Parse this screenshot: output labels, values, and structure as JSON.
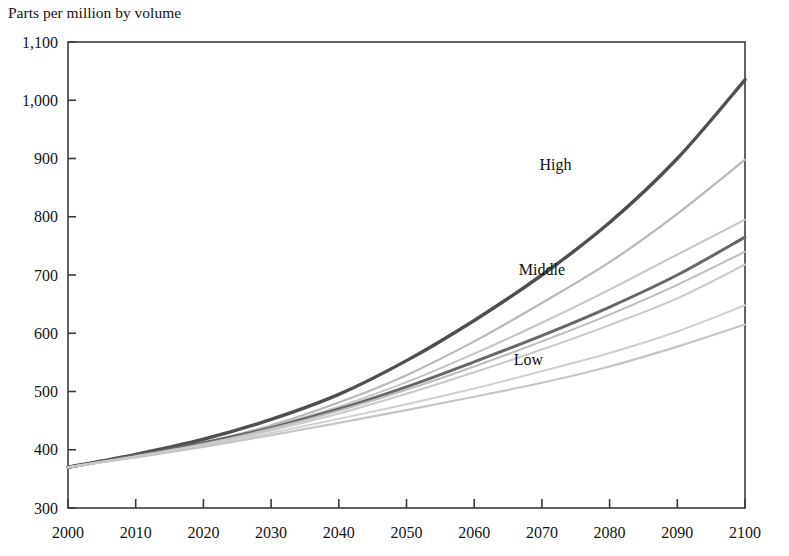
{
  "chart_data": {
    "type": "line",
    "title": "Parts per million by volume",
    "xlabel": "",
    "ylabel": "Parts per million by volume",
    "xlim": [
      2000,
      2100
    ],
    "ylim": [
      300,
      1100
    ],
    "ytick_step": 100,
    "xtick_step": 10,
    "grid": false,
    "legend": "inline-annotations",
    "xticks": [
      "2000",
      "2010",
      "2020",
      "2030",
      "2040",
      "2050",
      "2060",
      "2070",
      "2080",
      "2090",
      "2100"
    ],
    "yticks": [
      "300",
      "400",
      "500",
      "600",
      "700",
      "800",
      "900",
      "1,000",
      "1,100"
    ],
    "x": [
      2000,
      2010,
      2020,
      2030,
      2040,
      2050,
      2060,
      2070,
      2080,
      2090,
      2100
    ],
    "annotations": [
      {
        "text": "High",
        "x": 2072,
        "y": 880,
        "name": "series-label-high"
      },
      {
        "text": "Middle",
        "x": 2070,
        "y": 700,
        "name": "series-label-middle"
      },
      {
        "text": "Low",
        "x": 2068,
        "y": 545,
        "name": "series-label-low"
      }
    ],
    "series": [
      {
        "name": "High",
        "color": "#4f4f4f",
        "width": 3.4,
        "values": [
          370,
          392,
          418,
          452,
          495,
          553,
          622,
          700,
          790,
          900,
          1035
        ]
      },
      {
        "name": "Scenario A1",
        "color": "#b9b9b9",
        "width": 2.2,
        "values": [
          370,
          389,
          412,
          442,
          481,
          528,
          586,
          652,
          722,
          805,
          898
        ]
      },
      {
        "name": "Scenario A2",
        "color": "#c4c4c4",
        "width": 2.0,
        "values": [
          370,
          389,
          411,
          440,
          474,
          516,
          565,
          618,
          675,
          735,
          795
        ]
      },
      {
        "name": "Middle",
        "color": "#676767",
        "width": 3.0,
        "values": [
          370,
          390,
          412,
          438,
          470,
          508,
          551,
          596,
          645,
          700,
          765
        ]
      },
      {
        "name": "Scenario B1",
        "color": "#bdbdbd",
        "width": 2.0,
        "values": [
          370,
          389,
          410,
          436,
          467,
          503,
          543,
          586,
          632,
          683,
          740
        ]
      },
      {
        "name": "Scenario B2",
        "color": "#c9c9c9",
        "width": 2.0,
        "values": [
          370,
          388,
          409,
          433,
          462,
          496,
          533,
          572,
          614,
          660,
          718
        ]
      },
      {
        "name": "Scenario C1",
        "color": "#cfcfcf",
        "width": 2.0,
        "values": [
          370,
          388,
          407,
          429,
          453,
          478,
          505,
          535,
          566,
          603,
          648
        ]
      },
      {
        "name": "Low",
        "color": "#c6c6c6",
        "width": 2.2,
        "values": [
          370,
          387,
          405,
          425,
          446,
          468,
          491,
          515,
          543,
          577,
          615
        ]
      }
    ]
  }
}
